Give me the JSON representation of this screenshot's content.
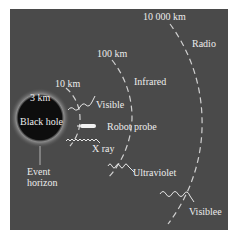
{
  "diagram": {
    "distance_labels": [
      "3 km",
      "10 km",
      "100 km",
      "10 000 km"
    ],
    "wave_labels": {
      "radio": "Radio",
      "infrared": "Infrared",
      "visible_near": "Visible",
      "xray": "X ray",
      "ultraviolet": "Ultraviolet",
      "visible_far": "Visiblee"
    },
    "objects": {
      "black_hole": "Black hole",
      "probe": "Robot probe",
      "event_horizon": "Event horizon"
    },
    "colors": {
      "background": "#4a4a4a",
      "black_hole": "#0d0d0d",
      "text": "#ececec",
      "dashes": "#d0d0d0"
    }
  }
}
